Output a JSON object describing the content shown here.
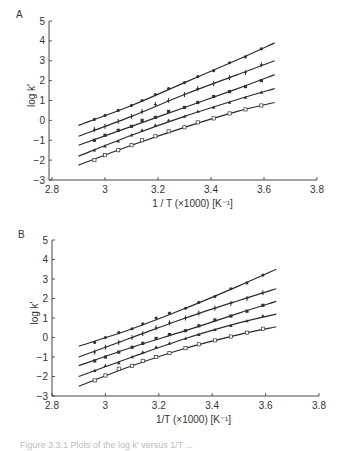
{
  "chart_data": [
    {
      "type": "line",
      "panel_label": "A",
      "title": "",
      "xlabel": "1 / T (×1000) [K⁻¹]",
      "ylabel": "log k'",
      "xlim": [
        2.8,
        3.8
      ],
      "ylim": [
        -3,
        5
      ],
      "xticks": [
        2.8,
        3,
        3.2,
        3.4,
        3.6,
        3.8
      ],
      "xtick_labels": [
        "2.8",
        "3",
        "3.2",
        "3.4",
        "3.6",
        "3.8"
      ],
      "yticks": [
        -3,
        -2,
        -1,
        0,
        1,
        2,
        3,
        4,
        5
      ],
      "ytick_labels": [
        "−3",
        "−2",
        "−1",
        "0",
        "1",
        "2",
        "3",
        "4",
        "5"
      ],
      "grid": false,
      "legend": null,
      "x": [
        2.96,
        3.0,
        3.05,
        3.1,
        3.14,
        3.19,
        3.24,
        3.3,
        3.35,
        3.41,
        3.47,
        3.53,
        3.59
      ],
      "series": [
        {
          "name": "series-1",
          "marker": "circle",
          "values": [
            0.05,
            0.25,
            0.5,
            0.75,
            1.0,
            1.3,
            1.6,
            1.9,
            2.2,
            2.5,
            2.9,
            3.2,
            3.6
          ],
          "fit": [
            [
              2.9,
              -0.25
            ],
            [
              3.1,
              0.75
            ],
            [
              3.3,
              1.9
            ],
            [
              3.5,
              3.05
            ],
            [
              3.64,
              3.9
            ]
          ]
        },
        {
          "name": "series-2",
          "marker": "plus",
          "values": [
            -0.45,
            -0.3,
            -0.05,
            0.2,
            0.45,
            0.8,
            1.0,
            1.3,
            1.6,
            1.85,
            2.15,
            2.4,
            2.8
          ],
          "fit": [
            [
              2.9,
              -0.8
            ],
            [
              3.1,
              0.2
            ],
            [
              3.3,
              1.3
            ],
            [
              3.5,
              2.3
            ],
            [
              3.64,
              3.0
            ]
          ]
        },
        {
          "name": "series-3",
          "marker": "square",
          "values": [
            -1.0,
            -0.75,
            -0.5,
            -0.3,
            0.0,
            0.15,
            0.45,
            0.65,
            0.9,
            1.2,
            1.45,
            1.7,
            2.0
          ],
          "fit": [
            [
              2.9,
              -1.25
            ],
            [
              3.1,
              -0.3
            ],
            [
              3.3,
              0.65
            ],
            [
              3.5,
              1.6
            ],
            [
              3.64,
              2.3
            ]
          ]
        },
        {
          "name": "series-4",
          "marker": "triangle",
          "values": [
            -1.5,
            -1.3,
            -1.05,
            -0.75,
            -0.5,
            -0.25,
            0.0,
            0.2,
            0.45,
            0.65,
            0.9,
            1.15,
            1.4
          ],
          "fit": [
            [
              2.9,
              -1.8
            ],
            [
              3.1,
              -0.75
            ],
            [
              3.3,
              0.2
            ],
            [
              3.5,
              1.05
            ],
            [
              3.64,
              1.6
            ]
          ]
        },
        {
          "name": "series-5",
          "marker": "open-square",
          "values": [
            -2.0,
            -1.75,
            -1.5,
            -1.25,
            -1.0,
            -0.8,
            -0.55,
            -0.35,
            -0.1,
            0.1,
            0.35,
            0.55,
            0.75
          ],
          "fit": [
            [
              2.9,
              -2.25
            ],
            [
              3.1,
              -1.25
            ],
            [
              3.3,
              -0.35
            ],
            [
              3.5,
              0.45
            ],
            [
              3.64,
              0.9
            ]
          ]
        }
      ]
    },
    {
      "type": "line",
      "panel_label": "B",
      "title": "",
      "xlabel": "1/T (×1000) [K⁻¹]",
      "ylabel": "log k'",
      "xlim": [
        2.8,
        3.8
      ],
      "ylim": [
        -3,
        5
      ],
      "xticks": [
        2.8,
        3,
        3.2,
        3.4,
        3.6,
        3.8
      ],
      "xtick_labels": [
        "2.8",
        "3",
        "3.2",
        "3.4",
        "3.6",
        "3.8"
      ],
      "yticks": [
        -3,
        -2,
        -1,
        0,
        1,
        2,
        3,
        4,
        5
      ],
      "ytick_labels": [
        "−3",
        "−2",
        "−1",
        "0",
        "1",
        "2",
        "3",
        "4",
        "5"
      ],
      "grid": false,
      "legend": null,
      "x": [
        2.96,
        3.0,
        3.05,
        3.1,
        3.14,
        3.19,
        3.24,
        3.3,
        3.35,
        3.41,
        3.47,
        3.53,
        3.59
      ],
      "series": [
        {
          "name": "series-1",
          "marker": "circle",
          "values": [
            -0.25,
            0.0,
            0.25,
            0.45,
            0.7,
            1.0,
            1.25,
            1.5,
            1.8,
            2.1,
            2.5,
            2.8,
            3.2
          ],
          "fit": [
            [
              2.9,
              -0.45
            ],
            [
              3.1,
              0.45
            ],
            [
              3.3,
              1.5
            ],
            [
              3.5,
              2.65
            ],
            [
              3.64,
              3.5
            ]
          ]
        },
        {
          "name": "series-2",
          "marker": "plus",
          "values": [
            -0.75,
            -0.5,
            -0.25,
            0.0,
            0.2,
            0.5,
            0.75,
            1.0,
            1.25,
            1.5,
            1.75,
            2.0,
            2.3
          ],
          "fit": [
            [
              2.9,
              -1.0
            ],
            [
              3.1,
              0.0
            ],
            [
              3.3,
              1.0
            ],
            [
              3.5,
              1.9
            ],
            [
              3.64,
              2.5
            ]
          ]
        },
        {
          "name": "series-3",
          "marker": "square",
          "values": [
            -1.2,
            -1.0,
            -0.75,
            -0.5,
            -0.3,
            -0.05,
            0.15,
            0.35,
            0.6,
            0.9,
            1.1,
            1.35,
            1.65
          ],
          "fit": [
            [
              2.9,
              -1.45
            ],
            [
              3.1,
              -0.5
            ],
            [
              3.3,
              0.35
            ],
            [
              3.5,
              1.25
            ],
            [
              3.64,
              1.85
            ]
          ]
        },
        {
          "name": "series-4",
          "marker": "triangle",
          "values": [
            -1.7,
            -1.45,
            -1.3,
            -1.0,
            -0.75,
            -0.5,
            -0.3,
            -0.05,
            0.15,
            0.4,
            0.6,
            0.85,
            1.1
          ],
          "fit": [
            [
              2.9,
              -2.0
            ],
            [
              3.1,
              -1.0
            ],
            [
              3.3,
              -0.05
            ],
            [
              3.5,
              0.75
            ],
            [
              3.64,
              1.2
            ]
          ]
        },
        {
          "name": "series-5",
          "marker": "open-square",
          "values": [
            -2.2,
            -1.95,
            -1.6,
            -1.45,
            -1.2,
            -1.0,
            -0.8,
            -0.55,
            -0.35,
            -0.15,
            0.05,
            0.25,
            0.45
          ],
          "fit": [
            [
              2.9,
              -2.5
            ],
            [
              3.1,
              -1.45
            ],
            [
              3.3,
              -0.55
            ],
            [
              3.5,
              0.15
            ],
            [
              3.64,
              0.55
            ]
          ]
        }
      ]
    }
  ],
  "caption": "Figure 3.3.1  Plots of the log k′ versus 1/T ..."
}
